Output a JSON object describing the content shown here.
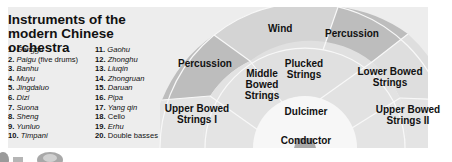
{
  "title": "Instruments of the modern Chinese orchestra",
  "instrument_list": {
    "column1": [
      {
        "num": "1.",
        "name": "Ganggu",
        "suffix": ""
      },
      {
        "num": "2.",
        "name": "Paigu",
        "suffix": " (five drums)"
      },
      {
        "num": "3.",
        "name": "Banhu",
        "suffix": ""
      },
      {
        "num": "4.",
        "name": "Muyu",
        "suffix": ""
      },
      {
        "num": "5.",
        "name": "Jingdaluo",
        "suffix": ""
      },
      {
        "num": "6.",
        "name": "Dizi",
        "suffix": ""
      },
      {
        "num": "7.",
        "name": "Suona",
        "suffix": ""
      },
      {
        "num": "8.",
        "name": "Sheng",
        "suffix": ""
      },
      {
        "num": "9.",
        "name": "Yunluo",
        "suffix": ""
      },
      {
        "num": "10.",
        "name": "Timpani",
        "suffix": ""
      }
    ],
    "column2": [
      {
        "num": "11.",
        "name": "Gaohu",
        "suffix": ""
      },
      {
        "num": "12.",
        "name": "Zhonghu",
        "suffix": ""
      },
      {
        "num": "13.",
        "name": "Liuqin",
        "suffix": ""
      },
      {
        "num": "14.",
        "name": "Zhongruan",
        "suffix": ""
      },
      {
        "num": "15.",
        "name": "Daruan",
        "suffix": ""
      },
      {
        "num": "16.",
        "name": "Pipa",
        "suffix": ""
      },
      {
        "num": "17.",
        "name": "Yang qin",
        "suffix": ""
      },
      {
        "num": "18.",
        "name": "Cello",
        "suffix": ""
      },
      {
        "num": "19.",
        "name": "Erhu",
        "suffix": ""
      },
      {
        "num": "20.",
        "name": "Double basses",
        "suffix": ""
      }
    ]
  },
  "seating_chart": {
    "outer_ring": {
      "left": "Percussion",
      "center": "Wind",
      "right": "Percussion"
    },
    "middle_ring": {
      "left": "Middle Bowed Strings",
      "center": "Plucked Strings",
      "right": "Lower Bowed Strings"
    },
    "side_band": {
      "left": "Upper Bowed Strings I",
      "right": "Upper Bowed Strings II"
    },
    "inner": "Dulcimer",
    "podium": "Conductor"
  },
  "labels": {
    "percussion_left_1": "Percussion",
    "wind": "Wind",
    "percussion_right": "Percussion",
    "middle_1": "Middle",
    "middle_2": "Bowed",
    "middle_3": "Strings",
    "plucked_1": "Plucked",
    "plucked_2": "Strings",
    "lower_1": "Lower Bowed",
    "lower_2": "Strings",
    "upper1_1": "Upper Bowed",
    "upper1_2": "Strings I",
    "upper2_1": "Upper Bowed",
    "upper2_2": "Strings II",
    "dulcimer": "Dulcimer",
    "conductor": "Conductor"
  },
  "colors": {
    "panel": "#ededed",
    "outer_light": "#d6d6d6",
    "outer_dark": "#bdbdbd",
    "middle": "#e2e2e2",
    "side_band": "#e6e6e6",
    "dulcimer": "#f7f7f7",
    "podium": "#a9a9a9",
    "divider": "#f8f8f8"
  }
}
